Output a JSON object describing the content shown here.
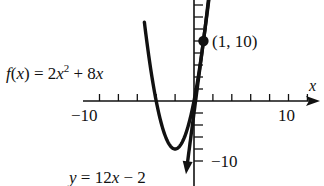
{
  "chart_data": {
    "type": "line",
    "title": "",
    "xlabel": "x",
    "ylabel": "",
    "xlim": [
      -11,
      13
    ],
    "ylim": [
      -12,
      17
    ],
    "grid": false,
    "x_ticks_labeled": [
      -10,
      10
    ],
    "y_ticks_labeled": [
      -10
    ],
    "tick_spacing": 2,
    "series": [
      {
        "name": "f(x) = 2x^2 + 8x",
        "kind": "parabola",
        "expression": "2*x^2 + 8*x",
        "vertex": [
          -2,
          -8
        ],
        "x_intercepts": [
          -4,
          0
        ],
        "points": [
          [
            -5.2,
            12.48
          ],
          [
            -5,
            10
          ],
          [
            -4.5,
            4.5
          ],
          [
            -4,
            0
          ],
          [
            -3.5,
            -3.5
          ],
          [
            -3,
            -6
          ],
          [
            -2.5,
            -7.5
          ],
          [
            -2,
            -8
          ],
          [
            -1.5,
            -7.5
          ],
          [
            -1,
            -6
          ],
          [
            -0.5,
            -3.5
          ],
          [
            0,
            0
          ],
          [
            0.5,
            4.5
          ],
          [
            1,
            10
          ],
          [
            1.5,
            16.5
          ]
        ]
      },
      {
        "name": "y = 12x - 2",
        "kind": "tangent_line",
        "expression": "12*x - 2",
        "points": [
          [
            -0.85,
            -12.2
          ],
          [
            1.6,
            17.2
          ]
        ]
      }
    ],
    "annotations": [
      {
        "text": "(1, 10)",
        "point": [
          1,
          10
        ],
        "marker": "filled-circle"
      },
      {
        "text": "f(x) = 2x² + 8x",
        "target": "parabola"
      },
      {
        "text": "y = 12x − 2",
        "target": "tangent_line"
      }
    ]
  },
  "labels": {
    "axis_x": "x",
    "tick_neg10_x": "−10",
    "tick_pos10_x": "10",
    "tick_neg10_y": "−10",
    "point": "(1, 10)",
    "f_lhs": "f",
    "f_paren_open": "(",
    "f_var": "x",
    "f_paren_close": ")",
    "f_eq": " = 2",
    "f_x1": "x",
    "f_exp": "2",
    "f_plus": " + 8",
    "f_x2": "x",
    "line_y": "y",
    "line_eq": " = 12",
    "line_x": "x",
    "line_rest": " − 2"
  }
}
